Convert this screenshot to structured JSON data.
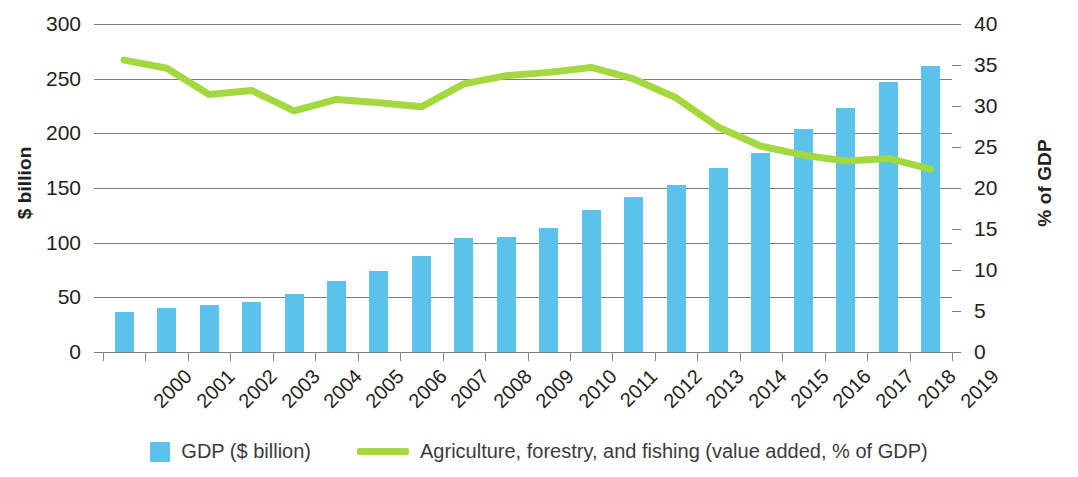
{
  "chart_data": {
    "type": "bar",
    "title": "",
    "categories": [
      "2000",
      "2001",
      "2002",
      "2003",
      "2004",
      "2005",
      "2006",
      "2007",
      "2008",
      "2009",
      "2010",
      "2011",
      "2012",
      "2013",
      "2014",
      "2015",
      "2016",
      "2017",
      "2018",
      "2019"
    ],
    "series": [
      {
        "name": "GDP ($ billion)",
        "type": "bar",
        "axis": "left",
        "color": "#5bc2ec",
        "values": [
          37,
          40,
          43,
          46,
          53,
          65,
          74,
          88,
          104,
          105,
          113,
          130,
          142,
          153,
          168,
          182,
          204,
          223,
          247,
          262
        ]
      },
      {
        "name": "Agriculture, forestry, and fishing (value added, % of GDP)",
        "type": "line",
        "axis": "right",
        "color": "#a3d93f",
        "values": [
          35.6,
          34.6,
          31.4,
          31.9,
          29.4,
          30.8,
          30.4,
          29.9,
          32.7,
          33.7,
          34.1,
          34.7,
          33.3,
          31.0,
          27.4,
          25.1,
          24.0,
          23.3,
          23.6,
          22.3
        ]
      }
    ],
    "xlabel": "",
    "ylabel": "$ billion",
    "y2label": "% of GDP",
    "ylim": [
      0,
      300
    ],
    "y2lim": [
      0,
      40
    ],
    "yticks": [
      0,
      50,
      100,
      150,
      200,
      250,
      300
    ],
    "y2ticks": [
      0,
      5,
      10,
      15,
      20,
      25,
      30,
      35,
      40
    ],
    "grid": true,
    "legend_position": "bottom"
  },
  "axes": {
    "left_title": "$ billion",
    "right_title": "% of GDP",
    "left_ticks": [
      "300",
      "250",
      "200",
      "150",
      "100",
      "50",
      "0"
    ],
    "right_ticks": [
      "40",
      "35",
      "30",
      "25",
      "20",
      "15",
      "10",
      "5",
      "0"
    ]
  },
  "legend": {
    "bar_label": "GDP ($ billion)",
    "line_label": "Agriculture, forestry, and fishing (value added, % of GDP)"
  }
}
